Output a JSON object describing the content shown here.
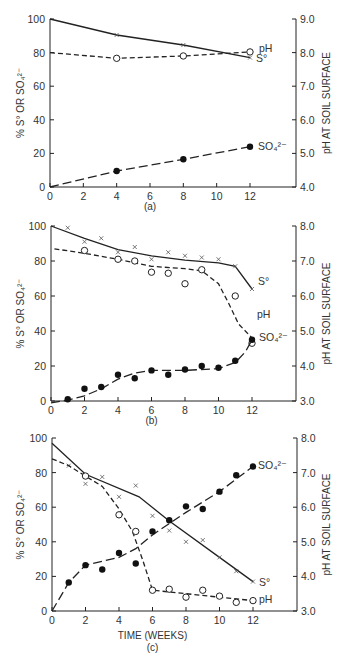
{
  "chart_data": [
    {
      "type": "line",
      "panel_label": "(a)",
      "xlabel": "",
      "ylabel": "% S° OR SO₄²⁻",
      "y2label": "pH AT SOIL SURFACE",
      "xlim": [
        0,
        14
      ],
      "ylim": [
        0,
        100
      ],
      "y2lim": [
        4.0,
        9.0
      ],
      "xticks": [
        0,
        2,
        4,
        6,
        8,
        10,
        12
      ],
      "xtick_labels": [
        "0",
        "2",
        "4",
        "6",
        "8",
        "10",
        "12"
      ],
      "yticks": [
        0,
        20,
        40,
        60,
        80,
        100
      ],
      "ytick_labels": [
        "0",
        "20",
        "40",
        "60",
        "80",
        "100"
      ],
      "y2ticks": [
        4.0,
        5.0,
        6.0,
        7.0,
        8.0,
        9.0
      ],
      "y2tick_labels": [
        "4.0",
        "5.0",
        "6.0",
        "7.0",
        "8.0",
        "9.0"
      ],
      "grid": false,
      "series": [
        {
          "name": "S°",
          "label": "S°",
          "axis": "left",
          "marker": "x",
          "line": "solid",
          "points": [
            [
              4,
              90.5
            ],
            [
              8,
              84.5
            ],
            [
              12,
              77
            ]
          ],
          "fit": [
            [
              0,
              100
            ],
            [
              4,
              90.5
            ],
            [
              8,
              84.5
            ],
            [
              12,
              77
            ]
          ]
        },
        {
          "name": "pH",
          "label": "pH",
          "axis": "right",
          "marker": "open-circle",
          "line": "dashed",
          "points": [
            [
              4,
              7.83
            ],
            [
              8,
              7.9
            ],
            [
              12,
              8.02
            ]
          ],
          "fit": [
            [
              0,
              8.0
            ],
            [
              4,
              7.83
            ],
            [
              8,
              7.9
            ],
            [
              12,
              8.02
            ]
          ]
        },
        {
          "name": "SO₄²⁻",
          "label": "SO₄²⁻",
          "axis": "left",
          "marker": "filled-circle",
          "line": "longdash",
          "points": [
            [
              4,
              9.5
            ],
            [
              8,
              16.5
            ],
            [
              12,
              24
            ]
          ],
          "fit": [
            [
              0,
              0
            ],
            [
              4,
              9.5
            ],
            [
              8,
              16.5
            ],
            [
              12,
              24
            ]
          ]
        }
      ]
    },
    {
      "type": "line",
      "panel_label": "(b)",
      "xlabel": "",
      "ylabel": "% S° OR SO₄²⁻",
      "y2label": "pH AT SOIL SURFACE",
      "xlim": [
        0,
        14
      ],
      "ylim": [
        0,
        100
      ],
      "y2lim": [
        3.0,
        8.0
      ],
      "xticks": [
        0,
        2,
        4,
        6,
        8,
        10,
        12
      ],
      "xtick_labels": [
        "0",
        "2",
        "4",
        "6",
        "8",
        "10",
        "12"
      ],
      "yticks": [
        0,
        20,
        40,
        60,
        80,
        100
      ],
      "ytick_labels": [
        "0",
        "20",
        "40",
        "60",
        "80",
        "100"
      ],
      "y2ticks": [
        3.0,
        4.0,
        5.0,
        6.0,
        7.0,
        8.0
      ],
      "y2tick_labels": [
        "3.0",
        "4.0",
        "5.0",
        "6.0",
        "7.0",
        "8.0"
      ],
      "grid": false,
      "series": [
        {
          "name": "S°",
          "label": "S°",
          "axis": "left",
          "marker": "x",
          "line": "solid",
          "points": [
            [
              1,
              99
            ],
            [
              2,
              91
            ],
            [
              3,
              93
            ],
            [
              4,
              85
            ],
            [
              5,
              88
            ],
            [
              6,
              81
            ],
            [
              7,
              85
            ],
            [
              8,
              83
            ],
            [
              9,
              82
            ],
            [
              10,
              81
            ],
            [
              11,
              77
            ],
            [
              12,
              64
            ]
          ],
          "fit": [
            [
              0,
              100
            ],
            [
              2,
              93
            ],
            [
              4,
              86.5
            ],
            [
              6,
              83
            ],
            [
              8,
              80.5
            ],
            [
              10,
              79
            ],
            [
              11,
              77
            ],
            [
              12,
              64
            ]
          ]
        },
        {
          "name": "pH",
          "label": "pH",
          "axis": "right",
          "marker": "open-circle",
          "line": "dashed",
          "points": [
            [
              2,
              7.3
            ],
            [
              4,
              7.05
            ],
            [
              5,
              7.0
            ],
            [
              6,
              6.68
            ],
            [
              7,
              6.65
            ],
            [
              8,
              6.35
            ],
            [
              9,
              6.75
            ],
            [
              11,
              6.0
            ],
            [
              12,
              4.65
            ]
          ],
          "fit": [
            [
              0.2,
              7.35
            ],
            [
              2,
              7.22
            ],
            [
              4,
              7.05
            ],
            [
              6,
              6.85
            ],
            [
              8,
              6.78
            ],
            [
              9,
              6.72
            ],
            [
              10,
              6.35
            ],
            [
              10.6,
              5.8
            ],
            [
              11.2,
              5.2
            ],
            [
              12,
              4.8
            ]
          ]
        },
        {
          "name": "SO₄²⁻",
          "label": "SO₄²⁻",
          "axis": "left",
          "marker": "filled-circle",
          "line": "longdash",
          "points": [
            [
              1,
              1
            ],
            [
              2,
              7
            ],
            [
              3,
              8
            ],
            [
              4,
              15
            ],
            [
              5,
              13
            ],
            [
              6,
              17.5
            ],
            [
              7,
              15
            ],
            [
              8,
              18
            ],
            [
              9,
              20
            ],
            [
              10,
              19
            ],
            [
              11,
              23
            ],
            [
              12,
              35
            ]
          ],
          "fit": [
            [
              0,
              -1
            ],
            [
              1,
              0.5
            ],
            [
              2,
              3
            ],
            [
              3,
              7
            ],
            [
              4,
              12.5
            ],
            [
              5,
              16
            ],
            [
              6,
              17.5
            ],
            [
              8,
              17.5
            ],
            [
              10,
              18.5
            ],
            [
              11,
              22
            ],
            [
              11.6,
              28
            ],
            [
              12,
              35
            ]
          ]
        }
      ]
    },
    {
      "type": "line",
      "panel_label": "(c)",
      "xlabel": "TIME (WEEKS)",
      "ylabel": "% S° OR SO₄²⁻",
      "y2label": "pH AT SOIL SURFACE",
      "xlim": [
        0,
        14
      ],
      "ylim": [
        0,
        100
      ],
      "y2lim": [
        3.0,
        8.0
      ],
      "xticks": [
        0,
        2,
        4,
        6,
        8,
        10,
        12
      ],
      "xtick_labels": [
        "0",
        "2",
        "4",
        "6",
        "8",
        "10",
        "12"
      ],
      "yticks": [
        0,
        20,
        40,
        60,
        80,
        100
      ],
      "ytick_labels": [
        "0",
        "20",
        "40",
        "60",
        "80",
        "100"
      ],
      "y2ticks": [
        3.0,
        4.0,
        5.0,
        6.0,
        7.0,
        8.0
      ],
      "y2tick_labels": [
        "3.0",
        "4.0",
        "5.0",
        "6.0",
        "7.0",
        "8.0"
      ],
      "grid": false,
      "series": [
        {
          "name": "S°",
          "label": "S°",
          "axis": "left",
          "marker": "x",
          "line": "solid",
          "points": [
            [
              1,
              84
            ],
            [
              2,
              73.5
            ],
            [
              3,
              77.5
            ],
            [
              4,
              66
            ],
            [
              5,
              72.5
            ],
            [
              6,
              55
            ],
            [
              7,
              46.5
            ],
            [
              8,
              40
            ],
            [
              9,
              41
            ],
            [
              10,
              31
            ],
            [
              11,
              23
            ],
            [
              12,
              17
            ]
          ],
          "fit": [
            [
              0,
              97
            ],
            [
              2,
              79
            ],
            [
              5.2,
              66
            ],
            [
              7,
              52
            ],
            [
              10,
              31
            ],
            [
              12,
              17
            ]
          ]
        },
        {
          "name": "pH",
          "label": "pH",
          "axis": "right",
          "marker": "open-circle",
          "line": "dashed",
          "points": [
            [
              2,
              6.9
            ],
            [
              4,
              5.78
            ],
            [
              5,
              5.3
            ],
            [
              6,
              3.6
            ],
            [
              7,
              3.63
            ],
            [
              8,
              3.4
            ],
            [
              9,
              3.6
            ],
            [
              10,
              3.43
            ],
            [
              11,
              3.25
            ],
            [
              12,
              3.3
            ]
          ],
          "fit": [
            [
              0,
              7.4
            ],
            [
              1,
              7.2
            ],
            [
              2,
              6.9
            ],
            [
              3,
              6.6
            ],
            [
              4,
              5.95
            ],
            [
              4.8,
              5.3
            ],
            [
              5.4,
              4.5
            ],
            [
              6,
              3.6
            ],
            [
              8,
              3.5
            ],
            [
              10,
              3.4
            ],
            [
              12,
              3.3
            ]
          ]
        },
        {
          "name": "SO₄²⁻",
          "label": "SO₄²⁻",
          "axis": "left",
          "marker": "filled-circle",
          "line": "longdash",
          "points": [
            [
              1,
              16.5
            ],
            [
              2,
              26.5
            ],
            [
              3,
              24
            ],
            [
              4,
              33.5
            ],
            [
              5,
              27.5
            ],
            [
              6,
              46
            ],
            [
              7,
              52.5
            ],
            [
              8,
              60.5
            ],
            [
              9,
              59
            ],
            [
              10,
              69
            ],
            [
              11,
              78.5
            ],
            [
              12,
              83.5
            ]
          ],
          "fit": [
            [
              0,
              0
            ],
            [
              1,
              16.5
            ],
            [
              2,
              26.5
            ],
            [
              4,
              31
            ],
            [
              5,
              36
            ],
            [
              6,
              44
            ],
            [
              8,
              57
            ],
            [
              10,
              69
            ],
            [
              12,
              83.5
            ]
          ]
        }
      ]
    }
  ]
}
